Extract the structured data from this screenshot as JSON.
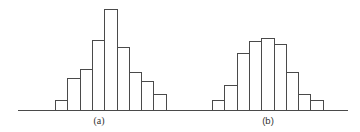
{
  "chart_data": [
    {
      "type": "bar",
      "title": "",
      "caption": "(a)",
      "xlabel": "",
      "ylabel": "",
      "grid": false,
      "legend": null,
      "categories": [
        "1",
        "2",
        "3",
        "4",
        "5",
        "6",
        "7",
        "8",
        "9"
      ],
      "values": [
        10,
        32,
        41,
        70,
        101,
        63,
        38,
        29,
        16
      ],
      "ylim": [
        0,
        105
      ]
    },
    {
      "type": "bar",
      "title": "",
      "caption": "(b)",
      "xlabel": "",
      "ylabel": "",
      "grid": false,
      "legend": null,
      "categories": [
        "1",
        "2",
        "3",
        "4",
        "5",
        "6",
        "7",
        "8",
        "9"
      ],
      "values": [
        10,
        25,
        57,
        69,
        72,
        66,
        38,
        16,
        10
      ],
      "ylim": [
        0,
        105
      ]
    }
  ],
  "layout": {
    "baseline_y": 110,
    "bar_width": 12.3,
    "panels": [
      {
        "axis_x0": 18,
        "axis_x1": 180,
        "bars_x0": 55,
        "label_x": 99
      },
      {
        "axis_x0": 180,
        "axis_x1": 348,
        "bars_x0": 212,
        "label_x": 268
      }
    ]
  }
}
